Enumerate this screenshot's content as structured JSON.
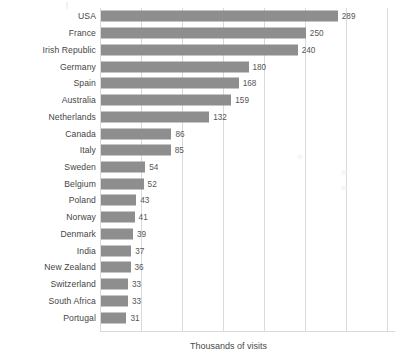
{
  "chart": {
    "axis_label": "Thousands of visits"
  },
  "chart_data": {
    "type": "bar",
    "orientation": "horizontal",
    "title": "",
    "subtitle": "",
    "xlabel": "Thousands of visits",
    "ylabel": "",
    "xlim": [
      0,
      360
    ],
    "grid": true,
    "gridline_values": [
      0,
      50,
      100,
      150,
      200,
      250,
      300,
      350
    ],
    "legend": null,
    "bar_color": "#8e8e8e",
    "value_labels_shown": true,
    "categories": [
      "USA",
      "France",
      "Irish Republic",
      "Germany",
      "Spain",
      "Australia",
      "Netherlands",
      "Canada",
      "Italy",
      "Sweden",
      "Belgium",
      "Poland",
      "Norway",
      "Denmark",
      "India",
      "New Zealand",
      "Switzerland",
      "South Africa",
      "Portugal"
    ],
    "values": [
      289,
      250,
      240,
      180,
      168,
      159,
      132,
      86,
      85,
      54,
      52,
      43,
      41,
      39,
      37,
      36,
      33,
      33,
      31
    ]
  }
}
